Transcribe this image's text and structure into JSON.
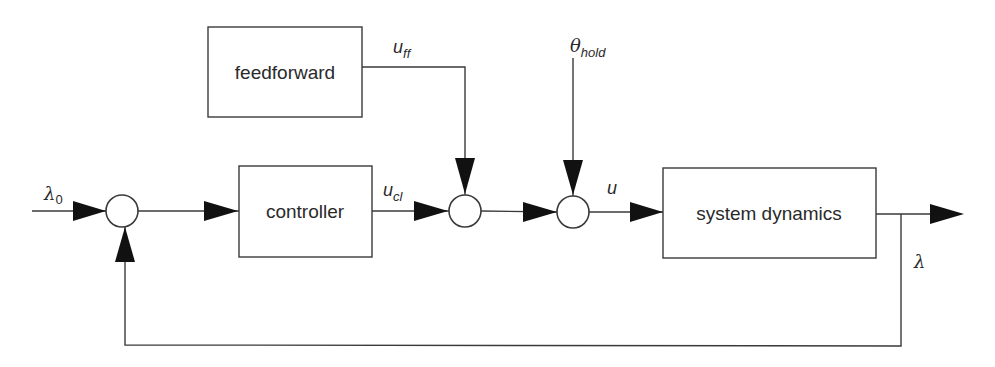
{
  "diagram": {
    "type": "block-diagram",
    "title": "",
    "blocks": {
      "feedforward": {
        "label": "feedforward"
      },
      "controller": {
        "label": "controller"
      },
      "system_dynamics": {
        "label": "system dynamics"
      }
    },
    "signals": {
      "reference": {
        "symbol": "λ",
        "subscript": "0"
      },
      "feedforward_output": {
        "symbol": "u",
        "subscript": "ff"
      },
      "controller_output": {
        "symbol": "u",
        "subscript": "cl"
      },
      "hold_input": {
        "symbol": "θ",
        "subscript": "hold"
      },
      "plant_input": {
        "symbol": "u",
        "subscript": ""
      },
      "output": {
        "symbol": "λ",
        "subscript": ""
      }
    },
    "junctions": [
      "sum-reference-feedback",
      "sum-feedforward-controller",
      "sum-hold"
    ],
    "connections": [
      "λ0 → sum-reference-feedback",
      "sum-reference-feedback → controller",
      "controller (u_cl) → sum-feedforward-controller",
      "feedforward (u_ff) → sum-feedforward-controller",
      "sum-feedforward-controller → sum-hold",
      "θ_hold → sum-hold",
      "sum-hold (u) → system dynamics",
      "system dynamics → output",
      "output (λ) → feedback → sum-reference-feedback"
    ],
    "colors": {
      "line": "#3a3a3a",
      "arrow": "#111111",
      "background": "#ffffff"
    }
  }
}
